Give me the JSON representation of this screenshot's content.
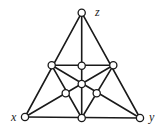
{
  "diagram": {
    "title": "",
    "stroke_color": "#1a1a1a",
    "node_fill": "#ffffff",
    "nodes": [
      {
        "id": "z",
        "label": "z",
        "x": 81.7,
        "y": 12.7,
        "label_x": 95,
        "label_y": 16
      },
      {
        "id": "x",
        "label": "x",
        "x": 25,
        "y": 117,
        "label_x": 11,
        "label_y": 121
      },
      {
        "id": "y",
        "label": "y",
        "x": 140,
        "y": 118,
        "label_x": 149,
        "label_y": 121
      },
      {
        "id": "left_mid",
        "label": "",
        "x": 51.7,
        "y": 65.3
      },
      {
        "id": "right_mid",
        "label": "",
        "x": 113.3,
        "y": 65.3
      },
      {
        "id": "top_inner",
        "label": "",
        "x": 81.7,
        "y": 65.7
      },
      {
        "id": "center",
        "label": "",
        "x": 81.7,
        "y": 84
      },
      {
        "id": "lower_left_inner",
        "label": "",
        "x": 65.7,
        "y": 93.3
      },
      {
        "id": "lower_right_inner",
        "label": "",
        "x": 96.7,
        "y": 93.3
      },
      {
        "id": "bottom_mid",
        "label": "",
        "x": 81.7,
        "y": 118
      }
    ],
    "edges": [
      [
        "z",
        "x"
      ],
      [
        "z",
        "y"
      ],
      [
        "x",
        "y"
      ],
      [
        "z",
        "bottom_mid"
      ],
      [
        "left_mid",
        "right_mid"
      ],
      [
        "left_mid",
        "bottom_mid"
      ],
      [
        "right_mid",
        "bottom_mid"
      ],
      [
        "x",
        "right_mid"
      ],
      [
        "y",
        "left_mid"
      ]
    ]
  }
}
